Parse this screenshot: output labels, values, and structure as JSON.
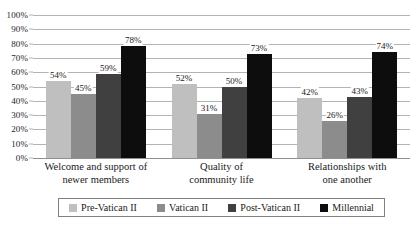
{
  "chart_data": {
    "type": "bar",
    "title": "",
    "subtitle": "",
    "xlabel": "",
    "ylabel": "",
    "ylim": [
      0,
      100
    ],
    "y_unit": "%",
    "grid": true,
    "legend_position": "bottom",
    "categories": [
      "Welcome and support of newer members",
      "Quality of community life",
      "Relationships with one another"
    ],
    "category_lines": [
      [
        "Welcome and support of",
        "newer members"
      ],
      [
        "Quality of",
        "community life"
      ],
      [
        "Relationships with",
        "one another"
      ]
    ],
    "y_ticks": [
      "0%",
      "10%",
      "20%",
      "30%",
      "40%",
      "50%",
      "60%",
      "70%",
      "80%",
      "90%",
      "100%"
    ],
    "y_tick_values": [
      0,
      10,
      20,
      30,
      40,
      50,
      60,
      70,
      80,
      90,
      100
    ],
    "series": [
      {
        "name": "Pre-Vatican II",
        "color": "#bfbfbf",
        "values": [
          54,
          52,
          42
        ],
        "labels": [
          "54%",
          "52%",
          "42%"
        ]
      },
      {
        "name": "Vatican II",
        "color": "#8c8c8c",
        "values": [
          45,
          31,
          26
        ],
        "labels": [
          "45%",
          "31%",
          "26%"
        ]
      },
      {
        "name": "Post-Vatican II",
        "color": "#404040",
        "values": [
          59,
          50,
          43
        ],
        "labels": [
          "59%",
          "50%",
          "43%"
        ]
      },
      {
        "name": "Millennial",
        "color": "#0d0d0d",
        "values": [
          78,
          73,
          74
        ],
        "labels": [
          "78%",
          "73%",
          "74%"
        ]
      }
    ]
  },
  "legend": {
    "items": [
      {
        "label": "Pre-Vatican II",
        "color": "#bfbfbf"
      },
      {
        "label": "Vatican II",
        "color": "#8c8c8c"
      },
      {
        "label": "Post-Vatican II",
        "color": "#404040"
      },
      {
        "label": "Millennial",
        "color": "#0d0d0d"
      }
    ]
  },
  "colors": {
    "gridline": "#b3b3b3",
    "axis": "#8f8f8f",
    "text": "#1a1a1a",
    "legend_border": "#808080",
    "background": "#ffffff"
  }
}
